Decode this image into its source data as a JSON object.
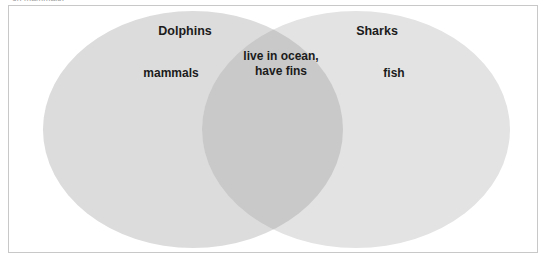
{
  "caption": {
    "clipped_text": "on mammals."
  },
  "diagram": {
    "type": "venn-2-set",
    "left_set": {
      "title": "Dolphins",
      "unique": "mammals"
    },
    "right_set": {
      "title": "Sharks",
      "unique": "fish"
    },
    "intersection": {
      "text": "live in ocean, have fins"
    }
  },
  "colors": {
    "left_circle_fill": "#dcdcdc",
    "right_circle_fill": "#e3e3e3",
    "overlap_fill": "#c9c9c9",
    "frame_border": "#c8c8c8",
    "text": "#1b1b1b",
    "caption_text": "#9a9a9a",
    "background": "#ffffff"
  }
}
